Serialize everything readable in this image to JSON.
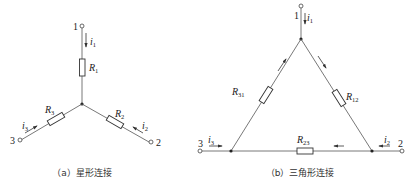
{
  "star": {
    "caption": "（a）星形连接",
    "terminals": {
      "t1": "1",
      "t2": "2",
      "t3": "3"
    },
    "resistors": {
      "r1": "R",
      "r1_sub": "1",
      "r2": "R",
      "r2_sub": "2",
      "r3": "R",
      "r3_sub": "3"
    },
    "currents": {
      "i1": "i",
      "i1_sub": "1",
      "i2": "i",
      "i2_sub": "2",
      "i3": "i",
      "i3_sub": "3"
    }
  },
  "delta": {
    "caption": "（b）三角形连接",
    "terminals": {
      "t1": "1",
      "t2": "2",
      "t3": "3"
    },
    "resistors": {
      "r12": "R",
      "r12_sub": "12",
      "r23": "R",
      "r23_sub": "23",
      "r31": "R",
      "r31_sub": "31"
    },
    "currents": {
      "i1": "i",
      "i1_sub": "1",
      "i2": "i",
      "i2_sub": "2",
      "i3": "i",
      "i3_sub": "3"
    }
  },
  "colors": {
    "line": "#444444",
    "text": "#222222"
  }
}
